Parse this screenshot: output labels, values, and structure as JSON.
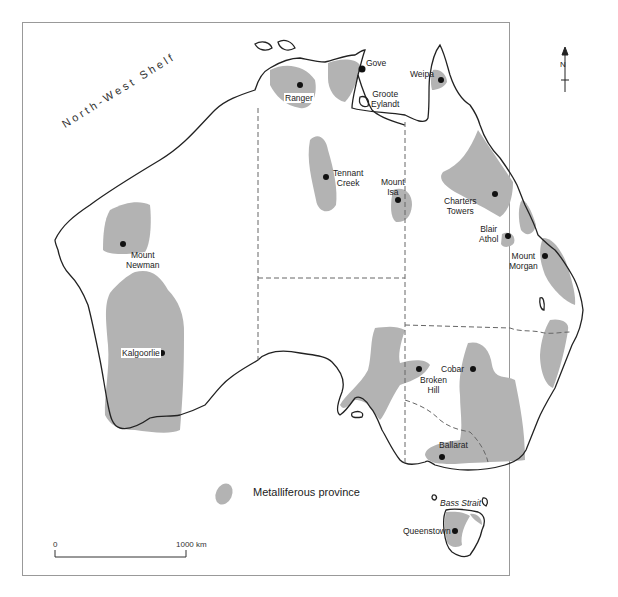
{
  "map": {
    "title": "Metalliferous provinces of Australia",
    "region_label": "North-West Shelf",
    "sea_label": "Bass Strait",
    "north_label": "N",
    "colors": {
      "province_fill": "#b3b3b3",
      "coastline": "#222222",
      "border_dashed": "#666666",
      "frame": "#888888",
      "site_dot": "#111111"
    },
    "sites": [
      {
        "name": "Ranger",
        "label": "Ranger"
      },
      {
        "name": "Gove",
        "label": "Gove"
      },
      {
        "name": "Groote Eylandt",
        "label_line1": "Groote",
        "label_line2": "Eylandt"
      },
      {
        "name": "Weipa",
        "label": "Weipa"
      },
      {
        "name": "Tennant Creek",
        "label_line1": "Tennant",
        "label_line2": "Creek"
      },
      {
        "name": "Mount Isa",
        "label_line1": "Mount",
        "label_line2": "Isa"
      },
      {
        "name": "Charters Towers",
        "label_line1": "Charters",
        "label_line2": "Towers"
      },
      {
        "name": "Blair Athol",
        "label_line1": "Blair",
        "label_line2": "Athol"
      },
      {
        "name": "Mount Morgan",
        "label_line1": "Mount",
        "label_line2": "Morgan"
      },
      {
        "name": "Mount Newman",
        "label_line1": "Mount",
        "label_line2": "Newman"
      },
      {
        "name": "Kalgoorlie",
        "label": "Kalgoorlie"
      },
      {
        "name": "Broken Hill",
        "label_line1": "Broken",
        "label_line2": "Hill"
      },
      {
        "name": "Cobar",
        "label": "Cobar"
      },
      {
        "name": "Ballarat",
        "label": "Ballarat"
      },
      {
        "name": "Queenstown",
        "label": "Queenstown"
      }
    ],
    "legend": {
      "label": "Metalliferous province"
    },
    "scale": {
      "start": "0",
      "end": "1000 km"
    }
  }
}
